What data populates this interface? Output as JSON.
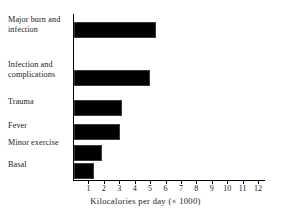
{
  "chart_data": {
    "type": "bar",
    "orientation": "horizontal",
    "title": "",
    "xlabel": "Kilocalories per day (× 1000)",
    "ylabel": "",
    "categories": [
      "Major burn and infection",
      "Infection and complications",
      "Trauma",
      "Fever",
      "Minor exercise",
      "Basal"
    ],
    "values": [
      5.3,
      4.9,
      3.1,
      3.0,
      1.8,
      1.3
    ],
    "xlim": [
      0,
      12.5
    ],
    "xticks": [
      1,
      2,
      3,
      4,
      5,
      6,
      7,
      8,
      9,
      10,
      11,
      12
    ],
    "xtick_labels": [
      "1",
      "2",
      "3",
      "4",
      "5",
      "6",
      "7",
      "8",
      "9",
      "10",
      "11",
      "12"
    ],
    "grid": false,
    "legend": null,
    "bar_color": "#000000",
    "axis_color": "#000000",
    "background_color": "#ffffff"
  }
}
